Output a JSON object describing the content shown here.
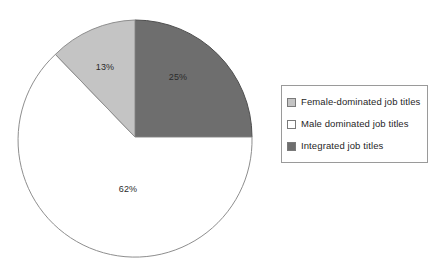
{
  "chart_data": {
    "type": "pie",
    "title": "",
    "categories": [
      "Integrated job titles",
      "Male dominated job titles",
      "Female-dominated job titles"
    ],
    "values": [
      25,
      62,
      13
    ],
    "labels": [
      "25%",
      "62%",
      "13%"
    ],
    "colors": [
      "#6e6e6e",
      "#ffffff",
      "#c4c4c4"
    ],
    "start_angle_deg": 0,
    "direction": "clockwise",
    "legend_position": "right",
    "grid": false,
    "xlabel": "",
    "ylabel": ""
  },
  "pie": {
    "slices": [
      {
        "name": "integrated-job-titles",
        "label": "25%",
        "value": 25,
        "color": "#6e6e6e",
        "stroke": "#4f4f4f",
        "path": "M 135 137 L 135 20 A 117 117 0 0 1 252 137 Z",
        "label_x": 178,
        "label_y": 78
      },
      {
        "name": "male-dominated-job-titles",
        "label": "62%",
        "value": 62,
        "color": "#ffffff",
        "stroke": "#8e8e8e",
        "path": "M 135 137 L 252 137 A 117 117 0 1 1 55.4 54.4 Z",
        "label_x": 128,
        "label_y": 190
      },
      {
        "name": "female-dominated-job-titles",
        "label": "13%",
        "value": 13,
        "color": "#c4c4c4",
        "stroke": "#8e8e8e",
        "path": "M 135 137 L 55.4 54.4 A 117 117 0 0 1 135 20 Z",
        "label_x": 105,
        "label_y": 68
      }
    ]
  },
  "legend": {
    "items": [
      {
        "label": "Female-dominated job titles",
        "color": "#c4c4c4"
      },
      {
        "label": "Male dominated job titles",
        "color": "#ffffff"
      },
      {
        "label": "Integrated job titles",
        "color": "#6e6e6e"
      }
    ]
  }
}
